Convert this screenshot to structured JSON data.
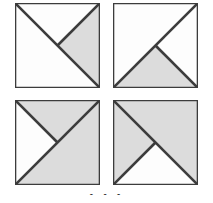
{
  "figure": {
    "title": "",
    "type": "geometric-tiling-matrix",
    "rows": 2,
    "cols": 2,
    "canvas": {
      "width": 213,
      "height": 203
    },
    "colors": {
      "shaded_fill": "#dcdcdc",
      "white_fill": "#fdfdfd",
      "stroke": "#3c3c3c",
      "background": "#ffffff"
    },
    "stroke_width_px": 2.2,
    "caption_partial": "•      •        •"
  },
  "cells": [
    {
      "id": "cell-top-left",
      "position": "top-left",
      "label": "A",
      "x": 15,
      "y": 3,
      "size": 85,
      "description": "Chevron opening upward: white triangle at top, shaded triangle at right, white triangle at bottom-left",
      "regions": [
        {
          "name": "top-triangle",
          "points": "0,0 100,0 50,50",
          "fill": "white"
        },
        {
          "name": "right-triangle",
          "points": "100,0 100,100 50,50",
          "fill": "shaded"
        },
        {
          "name": "bottom-left-region",
          "points": "0,0 50,50 100,100 0,100",
          "fill": "white"
        }
      ],
      "lines": [
        {
          "name": "diagonal-main",
          "from": "0,0",
          "to": "100,100"
        },
        {
          "name": "diagonal-partial-anti",
          "from": "100,0",
          "to": "50,50"
        }
      ]
    },
    {
      "id": "cell-top-right",
      "position": "top-right",
      "label": "B",
      "x": 113,
      "y": 3,
      "size": 85,
      "description": "Chevron opening rightward: white triangle at right, shaded triangle at bottom, white triangle at top-left",
      "regions": [
        {
          "name": "top-left-region",
          "points": "0,0 100,0 50,50 0,100",
          "fill": "white"
        },
        {
          "name": "right-triangle",
          "points": "100,0 100,100 50,50",
          "fill": "white"
        },
        {
          "name": "bottom-triangle",
          "points": "0,100 100,100 50,50",
          "fill": "shaded"
        }
      ],
      "lines": [
        {
          "name": "diagonal-anti",
          "from": "0,100",
          "to": "100,0"
        },
        {
          "name": "diagonal-partial-main",
          "from": "100,100",
          "to": "50,50"
        }
      ]
    },
    {
      "id": "cell-bottom-left",
      "position": "bottom-left",
      "label": "C",
      "x": 15,
      "y": 100,
      "size": 85,
      "description": "Chevron opening upward inverted: shaded triangle at top, white triangle at left, shaded bottom-right region",
      "regions": [
        {
          "name": "top-triangle",
          "points": "0,0 100,0 50,50",
          "fill": "shaded"
        },
        {
          "name": "left-triangle",
          "points": "0,0 50,50 0,100",
          "fill": "white"
        },
        {
          "name": "bottom-right-region",
          "points": "50,50 100,0 100,100 0,100",
          "fill": "shaded"
        }
      ],
      "lines": [
        {
          "name": "diagonal-anti",
          "from": "0,100",
          "to": "100,0"
        },
        {
          "name": "diagonal-partial-main",
          "from": "0,0",
          "to": "50,50"
        }
      ]
    },
    {
      "id": "cell-bottom-right",
      "position": "bottom-right",
      "label": "D",
      "x": 113,
      "y": 100,
      "size": 85,
      "description": "Chevron opening leftward: shaded triangle at left, white triangle at bottom, shaded triangle at top-right",
      "regions": [
        {
          "name": "left-triangle",
          "points": "0,0 50,50 0,100",
          "fill": "shaded"
        },
        {
          "name": "top-right-region",
          "points": "0,0 100,0 100,100 50,50",
          "fill": "shaded"
        },
        {
          "name": "bottom-triangle",
          "points": "0,100 50,50 100,100",
          "fill": "white"
        }
      ],
      "lines": [
        {
          "name": "diagonal-main",
          "from": "0,0",
          "to": "100,100"
        },
        {
          "name": "diagonal-partial-anti",
          "from": "0,100",
          "to": "50,50"
        }
      ]
    }
  ]
}
